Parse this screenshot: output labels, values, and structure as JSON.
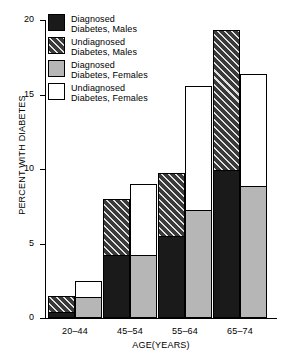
{
  "chart_data": {
    "type": "bar",
    "title": "",
    "subtitle": "",
    "xlabel": "AGE(YEARS)",
    "ylabel": "PERCENT WITH DIABETES",
    "categories": [
      "20–44",
      "45–54",
      "55–64",
      "65–74"
    ],
    "ylim": [
      0,
      20
    ],
    "yticks": [
      0,
      5,
      10,
      15,
      20
    ],
    "ytick_labels": [
      "0",
      "5",
      "10",
      "15",
      "20"
    ],
    "grid": false,
    "legend_position": "top-left",
    "stacked": true,
    "grouped_by": "sex",
    "series": [
      {
        "name": "Diagnosed Diabetes, Males",
        "key": "diag_m",
        "fill": "dark",
        "values": [
          0.5,
          4.3,
          5.6,
          10.0
        ]
      },
      {
        "name": "Undiagnosed Diabetes, Males",
        "key": "undiag_m",
        "fill": "hatch",
        "values": [
          1.0,
          3.7,
          4.1,
          9.3
        ]
      },
      {
        "name": "Diagnosed Diabetes, Females",
        "key": "diag_f",
        "fill": "gray",
        "values": [
          1.5,
          4.3,
          7.3,
          8.9
        ]
      },
      {
        "name": "Undiagnosed Diabetes, Females",
        "key": "undiag_f",
        "fill": "white",
        "values": [
          1.0,
          4.7,
          8.3,
          7.5
        ]
      }
    ],
    "totals": {
      "males": [
        1.5,
        8.0,
        9.7,
        19.3
      ],
      "females": [
        2.5,
        9.0,
        15.6,
        16.4
      ]
    },
    "annotations": []
  },
  "legend": {
    "items": [
      {
        "label_line1": "Diagnosed",
        "label_line2": "Diabetes, Males",
        "swatch": "dark"
      },
      {
        "label_line1": "Undiagnosed",
        "label_line2": "Diabetes, Males",
        "swatch": "hatch"
      },
      {
        "label_line1": "Diagnosed",
        "label_line2": "Diabetes, Females",
        "swatch": "gray"
      },
      {
        "label_line1": "Undiagnosed",
        "label_line2": "Diabetes, Females",
        "swatch": "white"
      }
    ]
  },
  "colors": {
    "diagnosed_male": "#1a1a1a",
    "undiagnosed_male": "#3a3a3a",
    "diagnosed_female": "#b6b6b6",
    "undiagnosed_female": "#ffffff",
    "axis": "#000000",
    "background": "#ffffff"
  }
}
